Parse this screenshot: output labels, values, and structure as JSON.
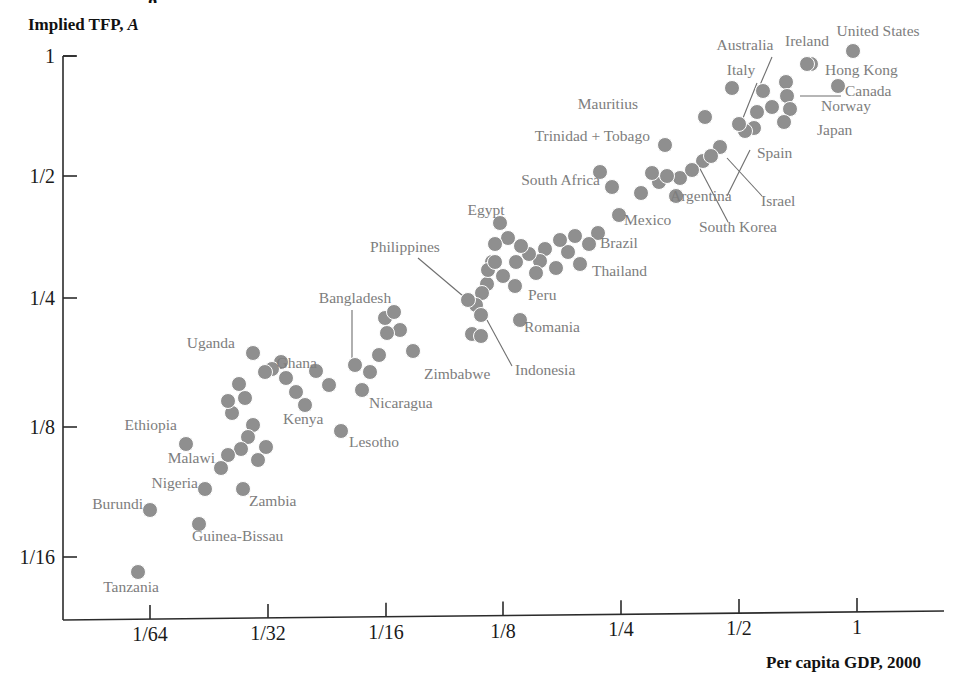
{
  "figure": {
    "partial_title_fragment": "g",
    "background_color": "#ffffff",
    "dot_color": "#8f8f8f",
    "label_color": "#7d7d7d",
    "axis_color": "#2b2b2b"
  },
  "chart_data": {
    "type": "scatter",
    "title": "",
    "xlabel": "Per capita GDP, 2000",
    "ylabel_text": "Implied TFP,",
    "ylabel_symbol": "A",
    "grid": false,
    "legend": "none",
    "x_scale": "log2",
    "y_scale": "log2",
    "xticks": [
      "1/64",
      "1/32",
      "1/16",
      "1/8",
      "1/4",
      "1/2",
      "1"
    ],
    "xtick_values": [
      0.015625,
      0.03125,
      0.0625,
      0.125,
      0.25,
      0.5,
      1
    ],
    "yticks": [
      "1",
      "1/2",
      "1/4",
      "1/8",
      "1/16"
    ],
    "ytick_values": [
      1,
      0.5,
      0.25,
      0.125,
      0.0625
    ],
    "xlim": [
      0.0098,
      1.55
    ],
    "ylim": [
      0.045,
      1.12
    ],
    "points": [
      {
        "label": "United States",
        "x": 1.0,
        "y": 1.0,
        "px": 853,
        "py": 51,
        "lx": 878,
        "ly": 36,
        "anchor": "middle",
        "leader": null
      },
      {
        "label": "Ireland",
        "x": 0.78,
        "y": 0.935,
        "px": 807,
        "py": 64,
        "lx": 807,
        "ly": 46,
        "anchor": "middle",
        "leader": null
      },
      {
        "label": "Hong Kong",
        "x": 0.7,
        "y": 0.845,
        "px": 786,
        "py": 82,
        "lx": 825,
        "ly": 75,
        "anchor": "start",
        "leader": null
      },
      {
        "label": "Canada",
        "x": 0.66,
        "y": 0.8,
        "px": 787,
        "py": 96,
        "lx": 845,
        "ly": 96,
        "anchor": "start",
        "leader": {
          "x1": 800,
          "y1": 96,
          "x2": 841,
          "y2": 96
        }
      },
      {
        "label": "Norway",
        "x": 0.64,
        "y": 0.76,
        "px": 790,
        "py": 109,
        "lx": 821,
        "ly": 111,
        "anchor": "start",
        "leader": null
      },
      {
        "label": "Australia",
        "x": 0.6,
        "y": 0.82,
        "px": 763,
        "py": 91,
        "lx": 745,
        "ly": 50,
        "anchor": "middle",
        "leader": {
          "x1": 760,
          "y1": 85,
          "x2": 772,
          "y2": 57
        }
      },
      {
        "label": "Italy",
        "x": 0.5,
        "y": 0.7,
        "px": 739,
        "py": 124,
        "lx": 741,
        "ly": 75,
        "anchor": "middle",
        "leader": {
          "x1": 743,
          "y1": 118,
          "x2": 757,
          "y2": 83
        }
      },
      {
        "label": "Japan",
        "x": 0.63,
        "y": 0.71,
        "px": 784,
        "py": 122,
        "lx": 817,
        "ly": 135,
        "anchor": "start",
        "leader": null
      },
      {
        "label": "Spain",
        "x": 0.44,
        "y": 0.62,
        "px": 720,
        "py": 147,
        "lx": 757,
        "ly": 158,
        "anchor": "start",
        "leader": {
          "x1": 750,
          "y1": 150,
          "x2": 727,
          "y2": 196
        }
      },
      {
        "label": "Israel",
        "x": 0.41,
        "y": 0.585,
        "px": 711,
        "py": 156,
        "lx": 761,
        "ly": 206,
        "anchor": "start",
        "leader": {
          "x1": 762,
          "y1": 196,
          "x2": 727,
          "y2": 158
        }
      },
      {
        "label": "South Korea",
        "x": 0.35,
        "y": 0.545,
        "px": 692,
        "py": 170,
        "lx": 699,
        "ly": 232,
        "anchor": "start",
        "leader": {
          "x1": 728,
          "y1": 222,
          "x2": 697,
          "y2": 163
        }
      },
      {
        "label": "Mauritius",
        "x": 0.235,
        "y": 0.72,
        "px": 705,
        "py": 117,
        "lx": 638,
        "ly": 109,
        "anchor": "end",
        "leader": null
      },
      {
        "label": "Trinidad + Tobago",
        "x": 0.265,
        "y": 0.61,
        "px": 665,
        "py": 145,
        "lx": 650,
        "ly": 141,
        "anchor": "end",
        "leader": null
      },
      {
        "label": "Argentina",
        "x": 0.285,
        "y": 0.5,
        "px": 676,
        "py": 196,
        "lx": 670,
        "ly": 201,
        "anchor": "start",
        "leader": null
      },
      {
        "label": "South Africa",
        "x": 0.175,
        "y": 0.515,
        "px": 612,
        "py": 187,
        "lx": 600,
        "ly": 185,
        "anchor": "end",
        "leader": null
      },
      {
        "label": "Mexico",
        "x": 0.165,
        "y": 0.44,
        "px": 619,
        "py": 215,
        "lx": 624,
        "ly": 225,
        "anchor": "start",
        "leader": null
      },
      {
        "label": "Brazil",
        "x": 0.145,
        "y": 0.375,
        "px": 589,
        "py": 244,
        "lx": 600,
        "ly": 248,
        "anchor": "start",
        "leader": null
      },
      {
        "label": "Thailand",
        "x": 0.135,
        "y": 0.345,
        "px": 580,
        "py": 264,
        "lx": 592,
        "ly": 276,
        "anchor": "start",
        "leader": null
      },
      {
        "label": "Egypt",
        "x": 0.088,
        "y": 0.44,
        "px": 500,
        "py": 223,
        "lx": 486,
        "ly": 215,
        "anchor": "middle",
        "leader": null
      },
      {
        "label": "Peru",
        "x": 0.099,
        "y": 0.34,
        "px": 515,
        "py": 286,
        "lx": 528,
        "ly": 300,
        "anchor": "start",
        "leader": null
      },
      {
        "label": "Romania",
        "x": 0.104,
        "y": 0.315,
        "px": 520,
        "py": 320,
        "lx": 524,
        "ly": 332,
        "anchor": "start",
        "leader": null
      },
      {
        "label": "Philippines",
        "x": 0.066,
        "y": 0.33,
        "px": 468,
        "py": 300,
        "lx": 405,
        "ly": 252,
        "anchor": "middle",
        "leader": {
          "x1": 418,
          "y1": 258,
          "x2": 463,
          "y2": 296
        }
      },
      {
        "label": "Indonesia",
        "x": 0.07,
        "y": 0.315,
        "px": 481,
        "py": 315,
        "lx": 515,
        "ly": 375,
        "anchor": "start",
        "leader": {
          "x1": 512,
          "y1": 366,
          "x2": 487,
          "y2": 320
        }
      },
      {
        "label": "Bangladesh",
        "x": 0.03,
        "y": 0.205,
        "px": 355,
        "py": 365,
        "lx": 355,
        "ly": 303,
        "anchor": "middle",
        "leader": {
          "x1": 352,
          "y1": 310,
          "x2": 352,
          "y2": 358
        }
      },
      {
        "label": "Zimbabwe",
        "x": 0.043,
        "y": 0.185,
        "px": 413,
        "py": 351,
        "lx": 424,
        "ly": 379,
        "anchor": "start",
        "leader": null
      },
      {
        "label": "Nicaragua",
        "x": 0.041,
        "y": 0.165,
        "px": 362,
        "py": 390,
        "lx": 369,
        "ly": 408,
        "anchor": "start",
        "leader": null
      },
      {
        "label": "Ghana",
        "x": 0.026,
        "y": 0.175,
        "px": 329,
        "py": 385,
        "lx": 317,
        "ly": 368,
        "anchor": "end",
        "leader": null
      },
      {
        "label": "Kenya",
        "x": 0.024,
        "y": 0.152,
        "px": 305,
        "py": 405,
        "lx": 283,
        "ly": 424,
        "anchor": "start",
        "leader": null
      },
      {
        "label": "Lesotho",
        "x": 0.031,
        "y": 0.135,
        "px": 341,
        "py": 431,
        "lx": 349,
        "ly": 447,
        "anchor": "start",
        "leader": null
      },
      {
        "label": "Uganda",
        "x": 0.0165,
        "y": 0.195,
        "px": 253,
        "py": 353,
        "lx": 235,
        "ly": 348,
        "anchor": "end",
        "leader": null
      },
      {
        "label": "Ethiopia",
        "x": 0.0135,
        "y": 0.123,
        "px": 186,
        "py": 444,
        "lx": 177,
        "ly": 430,
        "anchor": "end",
        "leader": null
      },
      {
        "label": "Malawi",
        "x": 0.0145,
        "y": 0.098,
        "px": 221,
        "py": 468,
        "lx": 215,
        "ly": 463,
        "anchor": "end",
        "leader": null
      },
      {
        "label": "Nigeria",
        "x": 0.0148,
        "y": 0.088,
        "px": 205,
        "py": 489,
        "lx": 198,
        "ly": 488,
        "anchor": "end",
        "leader": null
      },
      {
        "label": "Burundi",
        "x": 0.012,
        "y": 0.08,
        "px": 150,
        "py": 510,
        "lx": 143,
        "ly": 509,
        "anchor": "end",
        "leader": null
      },
      {
        "label": "Zambia",
        "x": 0.0215,
        "y": 0.087,
        "px": 243,
        "py": 489,
        "lx": 249,
        "ly": 506,
        "anchor": "start",
        "leader": null
      },
      {
        "label": "Guinea-Bissau",
        "x": 0.0152,
        "y": 0.073,
        "px": 199,
        "py": 524,
        "lx": 192,
        "ly": 541,
        "anchor": "start",
        "leader": null
      },
      {
        "label": "Tanzania",
        "x": 0.0118,
        "y": 0.057,
        "px": 138,
        "py": 572,
        "lx": 131,
        "ly": 592,
        "anchor": "middle",
        "leader": null
      }
    ],
    "unlabeled_points": [
      [
        838,
        86
      ],
      [
        811,
        64
      ],
      [
        853,
        51
      ],
      [
        786,
        82
      ],
      [
        787,
        96
      ],
      [
        790,
        109
      ],
      [
        763,
        91
      ],
      [
        739,
        124
      ],
      [
        784,
        122
      ],
      [
        772,
        107
      ],
      [
        757,
        112
      ],
      [
        754,
        128
      ],
      [
        745,
        131
      ],
      [
        720,
        147
      ],
      [
        711,
        156
      ],
      [
        703,
        161
      ],
      [
        692,
        170
      ],
      [
        680,
        178
      ],
      [
        705,
        117
      ],
      [
        732,
        88
      ],
      [
        665,
        145
      ],
      [
        676,
        196
      ],
      [
        659,
        182
      ],
      [
        652,
        173
      ],
      [
        667,
        176
      ],
      [
        641,
        193
      ],
      [
        619,
        215
      ],
      [
        612,
        187
      ],
      [
        600,
        172
      ],
      [
        589,
        244
      ],
      [
        598,
        233
      ],
      [
        575,
        236
      ],
      [
        580,
        264
      ],
      [
        568,
        252
      ],
      [
        560,
        240
      ],
      [
        556,
        268
      ],
      [
        545,
        249
      ],
      [
        540,
        261
      ],
      [
        536,
        273
      ],
      [
        529,
        254
      ],
      [
        521,
        246
      ],
      [
        516,
        262
      ],
      [
        500,
        223
      ],
      [
        508,
        238
      ],
      [
        495,
        244
      ],
      [
        515,
        286
      ],
      [
        520,
        320
      ],
      [
        503,
        276
      ],
      [
        492,
        262
      ],
      [
        487,
        284
      ],
      [
        482,
        293
      ],
      [
        468,
        300
      ],
      [
        481,
        315
      ],
      [
        476,
        305
      ],
      [
        488,
        270
      ],
      [
        495,
        262
      ],
      [
        472,
        334
      ],
      [
        481,
        336
      ],
      [
        413,
        351
      ],
      [
        400,
        330
      ],
      [
        387,
        333
      ],
      [
        362,
        390
      ],
      [
        355,
        365
      ],
      [
        370,
        372
      ],
      [
        379,
        355
      ],
      [
        385,
        318
      ],
      [
        394,
        312
      ],
      [
        341,
        431
      ],
      [
        329,
        385
      ],
      [
        316,
        371
      ],
      [
        305,
        405
      ],
      [
        296,
        392
      ],
      [
        286,
        378
      ],
      [
        281,
        362
      ],
      [
        272,
        369
      ],
      [
        253,
        353
      ],
      [
        265,
        372
      ],
      [
        239,
        384
      ],
      [
        245,
        398
      ],
      [
        232,
        413
      ],
      [
        253,
        425
      ],
      [
        248,
        437
      ],
      [
        241,
        449
      ],
      [
        228,
        455
      ],
      [
        221,
        468
      ],
      [
        205,
        489
      ],
      [
        186,
        444
      ],
      [
        243,
        489
      ],
      [
        199,
        524
      ],
      [
        150,
        510
      ],
      [
        138,
        572
      ],
      [
        266,
        447
      ],
      [
        258,
        460
      ],
      [
        228,
        401
      ]
    ]
  },
  "axes": {
    "x_axis_name": "x-axis",
    "y_axis_name": "y-axis"
  }
}
